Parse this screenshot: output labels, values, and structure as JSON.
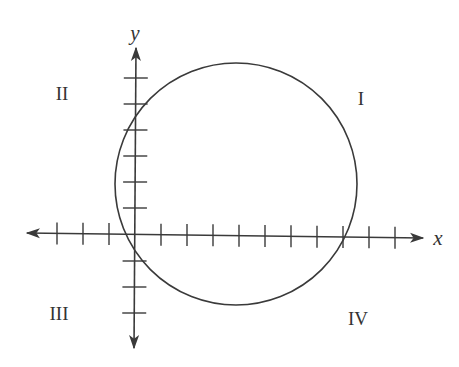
{
  "diagram": {
    "type": "coordinate-plane-with-circle",
    "colors": {
      "stroke": "#3a3a3a",
      "text": "#333333",
      "background": "#ffffff"
    },
    "axes": {
      "x_label": "x",
      "y_label": "y",
      "origin_px": [
        135,
        235
      ],
      "tick_spacing_px": 26,
      "x_ticks_negative": 3,
      "x_ticks_positive": 10,
      "y_ticks_positive": 6,
      "y_ticks_negative": 3
    },
    "circle": {
      "center_px": [
        236,
        184
      ],
      "radius_px": 121,
      "center_units_approx": [
        3.9,
        2.0
      ],
      "radius_units_approx": 4.6
    },
    "quadrants": [
      {
        "id": "I",
        "label": "I",
        "pos": [
          361,
          98
        ]
      },
      {
        "id": "II",
        "label": "II",
        "pos": [
          62,
          92
        ]
      },
      {
        "id": "III",
        "label": "III",
        "pos": [
          59,
          313
        ]
      },
      {
        "id": "IV",
        "label": "IV",
        "pos": [
          358,
          318
        ]
      }
    ]
  }
}
